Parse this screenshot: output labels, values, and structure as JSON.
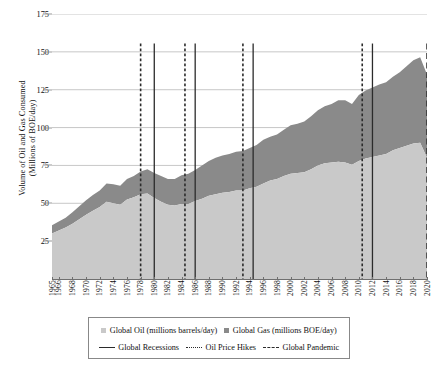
{
  "chart_data": {
    "type": "area",
    "title": "",
    "xlabel": "",
    "ylabel": "Volume of Oil and Gas Consumed (Millions of BOE/day)",
    "ylabel_line1": "Volume of Oil and Gas Consumed",
    "ylabel_line2": "(Millions of BOE/day)",
    "stacked": true,
    "ylim": [
      0,
      175
    ],
    "yticks": [
      25,
      50,
      75,
      100,
      125,
      150,
      175
    ],
    "xlim": [
      1965,
      2020
    ],
    "grid": "horizontal",
    "legend_position": "bottom",
    "x": [
      1965,
      1966,
      1967,
      1968,
      1969,
      1970,
      1971,
      1972,
      1973,
      1974,
      1975,
      1976,
      1977,
      1978,
      1979,
      1980,
      1981,
      1982,
      1983,
      1984,
      1985,
      1986,
      1987,
      1988,
      1989,
      1990,
      1991,
      1992,
      1993,
      1994,
      1995,
      1996,
      1997,
      1998,
      1999,
      2000,
      2001,
      2002,
      2003,
      2004,
      2005,
      2006,
      2007,
      2008,
      2009,
      2010,
      2011,
      2012,
      2013,
      2014,
      2015,
      2016,
      2017,
      2018,
      2019,
      2020
    ],
    "xtick_labels": [
      "1965",
      "1966",
      "1968",
      "1970",
      "1972",
      "1974",
      "1976",
      "1978",
      "1980",
      "1982",
      "1984",
      "1986",
      "1988",
      "1990",
      "1992",
      "1994",
      "1996",
      "1998",
      "2000",
      "2002",
      "2004",
      "2006",
      "2008",
      "2010",
      "2012",
      "2014",
      "2016",
      "2018",
      "2020"
    ],
    "series": [
      {
        "name": "Global Oil (millions barrels/day)",
        "color": "#c9c9c9",
        "values": [
          30.0,
          32.0,
          34.0,
          36.5,
          39.5,
          42.5,
          45.0,
          47.5,
          51.0,
          50.0,
          49.0,
          52.5,
          54.0,
          56.0,
          56.5,
          53.5,
          51.0,
          49.0,
          48.5,
          49.5,
          49.5,
          51.5,
          53.0,
          55.0,
          56.0,
          57.0,
          57.5,
          58.5,
          58.5,
          60.0,
          61.0,
          63.0,
          65.0,
          66.0,
          68.0,
          69.5,
          70.0,
          70.5,
          72.5,
          75.0,
          76.5,
          77.0,
          77.5,
          77.0,
          75.5,
          78.0,
          79.5,
          80.5,
          81.5,
          82.5,
          85.0,
          86.5,
          88.0,
          89.5,
          90.0,
          80.0
        ]
      },
      {
        "name": "Global Gas (millions BOE/day)",
        "color": "#8a8a8a",
        "values": [
          5.5,
          6.0,
          6.5,
          7.5,
          8.5,
          9.5,
          10.5,
          11.0,
          12.0,
          12.5,
          12.5,
          13.5,
          14.0,
          15.0,
          16.0,
          16.5,
          17.0,
          17.0,
          17.5,
          19.0,
          20.0,
          20.5,
          22.0,
          23.0,
          24.0,
          24.5,
          25.0,
          25.5,
          26.0,
          26.5,
          27.5,
          29.0,
          29.0,
          29.5,
          30.5,
          32.0,
          32.5,
          33.5,
          35.0,
          36.5,
          37.5,
          38.5,
          40.5,
          41.0,
          40.0,
          43.5,
          45.0,
          46.0,
          47.0,
          47.5,
          48.5,
          50.0,
          52.5,
          55.0,
          56.5,
          55.0
        ]
      }
    ],
    "event_lines": [
      {
        "year": 1978,
        "type": "oil-price-hike"
      },
      {
        "year": 1980,
        "type": "recession"
      },
      {
        "year": 1984.5,
        "type": "oil-price-hike"
      },
      {
        "year": 1986,
        "type": "recession"
      },
      {
        "year": 1993,
        "type": "oil-price-hike"
      },
      {
        "year": 1994.5,
        "type": "recession"
      },
      {
        "year": 2010.5,
        "type": "oil-price-hike"
      },
      {
        "year": 2012,
        "type": "recession"
      },
      {
        "year": 2020,
        "type": "pandemic"
      }
    ]
  },
  "legend": {
    "items": [
      {
        "label": "Global Oil (millions barrels/day)",
        "marker": "swatch",
        "color": "#c9c9c9"
      },
      {
        "label": "Global Gas (millions BOE/day)",
        "marker": "swatch",
        "color": "#8a8a8a"
      },
      {
        "label": "Global Recessions",
        "marker": "solid-line",
        "color": "#2b2b2b"
      },
      {
        "label": "Oil Price Hikes",
        "marker": "dotted-line",
        "color": "#2b2b2b"
      },
      {
        "label": "Global Pandemic",
        "marker": "dashed-line",
        "color": "#2b2b2b"
      }
    ]
  },
  "colors": {
    "oil": "#c9c9c9",
    "gas": "#8a8a8a",
    "grid": "#b9b9b9",
    "axis": "#6f6f6f",
    "event": "#2b2b2b"
  }
}
